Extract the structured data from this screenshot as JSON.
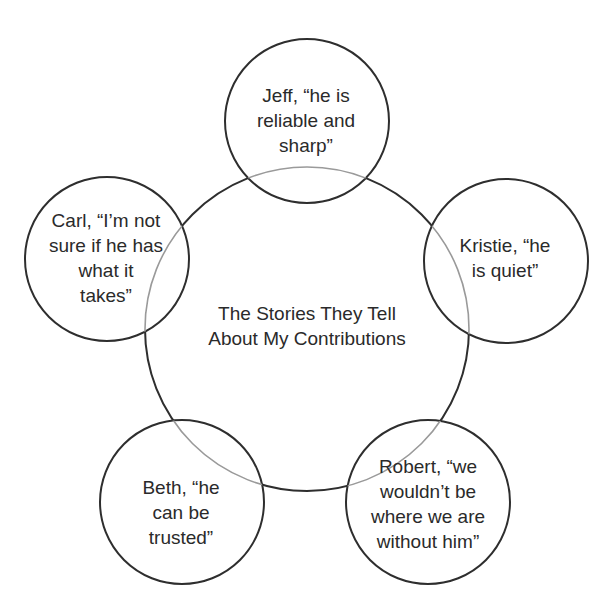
{
  "diagram": {
    "title": "The Stories They Tell\nAbout My Contributions",
    "stroke_color": "#2e2e2e",
    "overlap_color": "#9a9a9a",
    "nodes": [
      {
        "id": "jeff",
        "person": "Jeff",
        "text": "Jeff, “he is\nreliable and\nsharp”"
      },
      {
        "id": "kristie",
        "person": "Kristie",
        "text": "Kristie, “he\nis quiet”"
      },
      {
        "id": "robert",
        "person": "Robert",
        "text": "Robert, “we\nwouldn’t be\nwhere we are\nwithout him”"
      },
      {
        "id": "beth",
        "person": "Beth",
        "text": "Beth, “he\ncan be\ntrusted”"
      },
      {
        "id": "carl",
        "person": "Carl",
        "text": "Carl, “I’m not\nsure if he has\nwhat it\ntakes”"
      }
    ]
  }
}
